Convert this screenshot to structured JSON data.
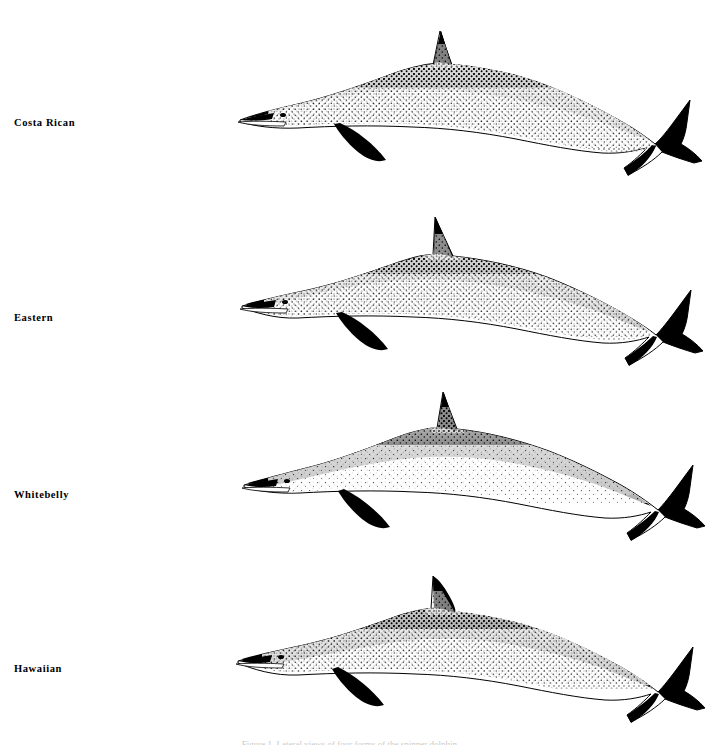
{
  "plate": {
    "background_color": "#ffffff",
    "ink_color": "#000000",
    "orientation": "lateral view, facing left",
    "specimen_count": 4,
    "caption": "Figure 1. Lateral views of four forms of the spinner dolphin."
  },
  "specimens": [
    {
      "label": "Costa Rican",
      "label_top": 117,
      "figure_top": 18,
      "figure_height": 165,
      "dorsal_fin": "erect, slightly canted forward, narrow apex",
      "cape_pattern": "dark dorsal cape heavily stippled, speckling extends far down the flank",
      "belly": "narrow pale belly stripe",
      "stipple_density": 0.85,
      "body_slenderness": "very slender, elongate"
    },
    {
      "label": "Eastern",
      "label_top": 312,
      "figure_top": 208,
      "figure_height": 160,
      "dorsal_fin": "triangular, strongly canted forward",
      "cape_pattern": "dark cape breaking into dense stipple over most of flank",
      "belly": "pale belly with stippled margin",
      "stipple_density": 0.8,
      "body_slenderness": "slender"
    },
    {
      "label": "Whitebelly",
      "label_top": 489,
      "figure_top": 385,
      "figure_height": 158,
      "dorsal_fin": "tall, erect, triangular with pointed apex",
      "cape_pattern": "sharply defined dark cape, flank largely white",
      "belly": "extensive clean white belly and flank",
      "stipple_density": 0.4,
      "body_slenderness": "robust"
    },
    {
      "label": "Hawaiian",
      "label_top": 663,
      "figure_top": 565,
      "figure_height": 165,
      "dorsal_fin": "falcate, swept backward",
      "cape_pattern": "tripartite pattern, dark cape above pale lateral field",
      "belly": "broad white belly, crisp boundary",
      "stipple_density": 0.55,
      "body_slenderness": "moderate"
    }
  ]
}
